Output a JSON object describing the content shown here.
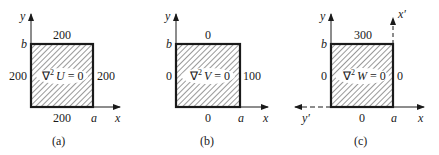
{
  "panels": [
    {
      "id": "a",
      "caption": "(a)",
      "equation": {
        "nabla": "∇",
        "sup": "2",
        "var": "U",
        "rest": " = 0"
      },
      "boundary": {
        "top": "200",
        "left": "200",
        "right": "200",
        "bottom": "200"
      },
      "axes": {
        "x": "x",
        "y": "y",
        "corner_x": "a",
        "corner_y": "b"
      }
    },
    {
      "id": "b",
      "caption": "(b)",
      "equation": {
        "nabla": "∇",
        "sup": "2",
        "var": "V",
        "rest": " = 0"
      },
      "boundary": {
        "top": "0",
        "left": "0",
        "right": "100",
        "bottom": "0"
      },
      "axes": {
        "x": "x",
        "y": "y",
        "corner_x": "a",
        "corner_y": "b"
      }
    },
    {
      "id": "c",
      "caption": "(c)",
      "equation": {
        "nabla": "∇",
        "sup": "2",
        "var": "W",
        "rest": " = 0"
      },
      "boundary": {
        "top": "300",
        "left": "0",
        "right": "0",
        "bottom": "0"
      },
      "axes": {
        "x": "x",
        "y": "y",
        "corner_x": "a",
        "corner_y": "b",
        "x_prime": "x′",
        "y_prime": "y′"
      }
    }
  ]
}
